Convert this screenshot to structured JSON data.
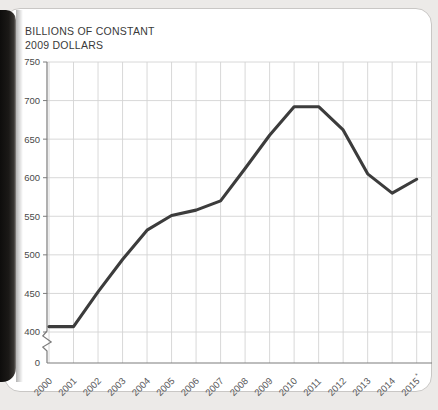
{
  "card": {
    "title_line1": "BILLIONS OF CONSTANT",
    "title_line2": "2009 DOLLARS",
    "title": "BILLIONS OF CONSTANT\n2009 DOLLARS"
  },
  "colors": {
    "page_background": "#eceae8",
    "card_background": "#ffffff",
    "card_border": "#c9c7c5",
    "line": "#3c3c3c",
    "grid": "#d4d4d4",
    "axis": "#7d7d7d",
    "title_text": "#3a3a3a",
    "tick_text": "#4a4a4a"
  },
  "chart_data": {
    "type": "line",
    "title": "BILLIONS OF CONSTANT 2009 DOLLARS",
    "xlabel": "",
    "ylabel": "BILLIONS OF CONSTANT 2009 DOLLARS",
    "categories": [
      "2000",
      "2001",
      "2002",
      "2003",
      "2004",
      "2005",
      "2006",
      "2007",
      "2008",
      "2009",
      "2010",
      "2011",
      "2012",
      "2013",
      "2014",
      "2015"
    ],
    "x_tick_labels": [
      "2000",
      "2001",
      "2002",
      "2003",
      "2004",
      "2005",
      "2006",
      "2007",
      "2008",
      "2009",
      "2010",
      "2011",
      "2012",
      "2013",
      "2014",
      "2015*"
    ],
    "x_tick_suffix_last": "*",
    "values": [
      407,
      407,
      452,
      494,
      532,
      551,
      558,
      570,
      612,
      655,
      692,
      692,
      662,
      605,
      580,
      598
    ],
    "y_tick_labels": [
      "0",
      "400",
      "450",
      "500",
      "550",
      "600",
      "650",
      "700",
      "750"
    ],
    "y_ticks": [
      400,
      450,
      500,
      550,
      600,
      650,
      700,
      750
    ],
    "ylim": [
      400,
      750
    ],
    "y_axis_break": true,
    "y_axis_zero_label": "0",
    "grid": "both",
    "legend": "none",
    "series": [
      {
        "name": "Billions of constant 2009 dollars",
        "values": [
          407,
          407,
          452,
          494,
          532,
          551,
          558,
          570,
          612,
          655,
          692,
          692,
          662,
          605,
          580,
          598
        ]
      }
    ]
  }
}
